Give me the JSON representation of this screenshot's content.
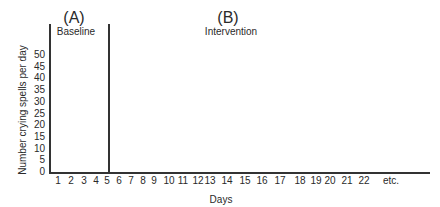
{
  "chart_data": {
    "type": "line",
    "title": "",
    "phases": [
      {
        "label": "(A)",
        "name": "Baseline",
        "days": [
          1,
          5
        ]
      },
      {
        "label": "(B)",
        "name": "Intervention",
        "days": [
          6,
          22
        ]
      }
    ],
    "xlabel": "Days",
    "ylabel": "Number crying spells per day",
    "x_tick_labels": [
      "1",
      "2",
      "3",
      "4",
      "5",
      "6",
      "7",
      "8",
      "9",
      "10",
      "11",
      "12",
      "13",
      "14",
      "15",
      "16",
      "17",
      "18",
      "19",
      "20",
      "21",
      "22",
      "etc."
    ],
    "y_tick_labels": [
      "0",
      "5",
      "10",
      "15",
      "20",
      "25",
      "30",
      "35",
      "40",
      "45",
      "50"
    ],
    "ylim": [
      0,
      50
    ],
    "series": [],
    "grid": false,
    "phase_divider_after_day": 5
  },
  "labels": {
    "phase_a": "(A)",
    "phase_a_name": "Baseline",
    "phase_b": "(B)",
    "phase_b_name": "Intervention",
    "xlabel": "Days",
    "ylabel": "Number crying spells per day"
  },
  "yticks": [
    "0",
    "5",
    "10",
    "15",
    "20",
    "25",
    "30",
    "35",
    "40",
    "45",
    "50"
  ],
  "xticks": [
    "1",
    "2",
    "3",
    "4",
    "5",
    "6",
    "7",
    "8",
    "9",
    "10",
    "11",
    "12",
    "13",
    "14",
    "15",
    "16",
    "17",
    "18",
    "19",
    "20",
    "21",
    "22",
    "etc."
  ]
}
